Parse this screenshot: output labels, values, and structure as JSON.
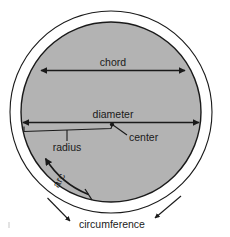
{
  "diagram": {
    "colors": {
      "disk_fill": "#b3b3b3",
      "disk_stroke": "#1a1a1a",
      "outer_circle_stroke": "#1a1a1a",
      "line": "#1a1a1a",
      "text": "#1a1a1a",
      "background": "#ffffff"
    },
    "labels": {
      "chord": "chord",
      "diameter": "diameter",
      "radius": "radius",
      "center": "center",
      "arc": "arc",
      "circumference": "circumference"
    },
    "geometry": {
      "disk_center_x": 111,
      "disk_center_y": 112,
      "disk_radius": 90,
      "outer_circle_radius": 101,
      "chord_y": 70,
      "chord_left_x": 41,
      "chord_right_x": 185,
      "diameter_y": 112,
      "diameter_left_x": 22,
      "diameter_right_x": 200,
      "arc_start_angle_deg": 193,
      "arc_end_angle_deg": 256
    }
  }
}
